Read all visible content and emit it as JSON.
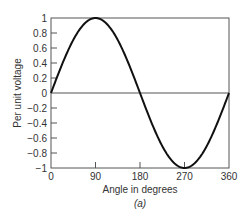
{
  "chart_data": {
    "type": "line",
    "title": "",
    "caption": "(a)",
    "xlabel": "Angle in degrees",
    "ylabel": "Per unit voltage",
    "xlim": [
      0,
      360
    ],
    "ylim": [
      -1,
      1
    ],
    "x_ticks": [
      0,
      90,
      180,
      270,
      360
    ],
    "x_tick_labels": [
      "0",
      "90",
      "180",
      "270",
      "360"
    ],
    "y_ticks": [
      1,
      0.8,
      0.6,
      0.4,
      0.2,
      0,
      -0.2,
      -0.4,
      -0.6,
      -0.8,
      -1
    ],
    "y_tick_labels": [
      "1",
      "0.8",
      "0.6",
      "0.4",
      "0.2",
      "0",
      "−0.2",
      "−0.4",
      "−0.6",
      "−0.8",
      "−1"
    ],
    "grid": false,
    "zero_line": true,
    "legend": null,
    "series": [
      {
        "name": "sin(θ)",
        "function": "sine",
        "x": [
          0,
          30,
          60,
          90,
          120,
          150,
          180,
          210,
          240,
          270,
          300,
          330,
          360
        ],
        "values": [
          0,
          0.5,
          0.866,
          1,
          0.866,
          0.5,
          0,
          -0.5,
          -0.866,
          -1,
          -0.866,
          -0.5,
          0
        ]
      }
    ]
  },
  "colors": {
    "curve": "#111111",
    "axis": "#555555",
    "text": "#333333"
  }
}
